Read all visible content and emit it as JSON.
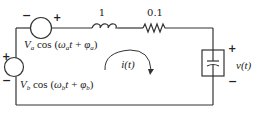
{
  "diagram": {
    "type": "circuit-schematic",
    "components": {
      "source_a": {
        "label": "V_a cos (ω_a t + φ_a)",
        "amplitude": "V",
        "amplitude_sub": "a",
        "func": "cos",
        "omega": "ω",
        "omega_sub": "a",
        "phase": "φ",
        "phase_sub": "a",
        "polarity_left": "−",
        "polarity_right": "+"
      },
      "source_b": {
        "label": "V_b cos (ω_b t + φ_b)",
        "amplitude": "V",
        "amplitude_sub": "b",
        "func": "cos",
        "omega": "ω",
        "omega_sub": "b",
        "phase": "φ",
        "phase_sub": "b",
        "polarity_top": "+",
        "polarity_bottom": "−"
      },
      "inductor": {
        "value": "1"
      },
      "resistor": {
        "value": "0.1"
      },
      "capacitor": {
        "voltage_label": "v(t)",
        "polarity_top": "+",
        "polarity_bottom": "−"
      }
    },
    "loop_current": {
      "label": "i(t)",
      "direction": "clockwise"
    }
  }
}
